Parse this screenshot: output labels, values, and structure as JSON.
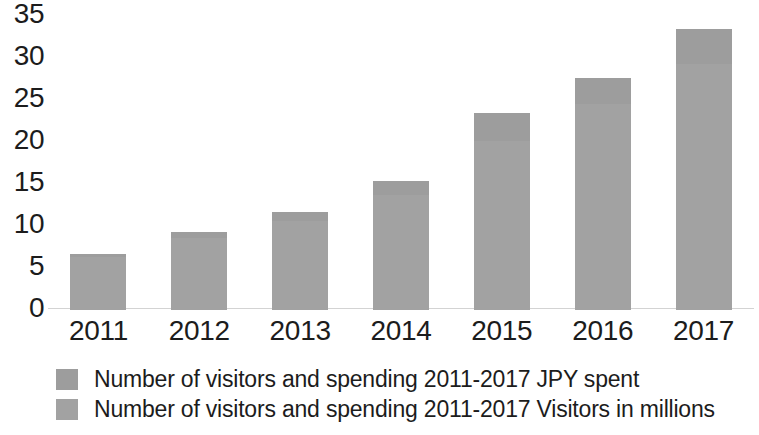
{
  "chart_data": {
    "type": "bar",
    "title": "",
    "subtitle": "",
    "xlabel": "",
    "ylabel": "",
    "categories": [
      "2011",
      "2012",
      "2013",
      "2014",
      "2015",
      "2016",
      "2017"
    ],
    "series": [
      {
        "name": "Number of visitors and spending 2011-2017 Visitors in millions",
        "color": "#a2a2a2",
        "values": [
          6.2,
          8.4,
          10.4,
          13.4,
          19.7,
          24.0,
          28.7
        ]
      },
      {
        "name": "Number of visitors and spending 2011-2017 JPY spent",
        "color": "#9d9d9d",
        "values": [
          0.3,
          0.7,
          1.0,
          1.7,
          3.3,
          3.1,
          4.1
        ]
      }
    ],
    "totals": [
      6.5,
      9.1,
      11.4,
      15.1,
      23.0,
      27.1,
      32.8
    ],
    "stacked": true,
    "ylim": [
      0,
      35
    ],
    "yticks": [
      "0",
      "5",
      "10",
      "15",
      "20",
      "25",
      "30",
      "35"
    ],
    "ytick_values": [
      0,
      5,
      10,
      15,
      20,
      25,
      30,
      35
    ],
    "grid": false,
    "legend_position": "bottom"
  },
  "legend": {
    "entries": [
      {
        "label": "Number of visitors and spending 2011-2017 JPY spent",
        "color": "#9d9d9d"
      },
      {
        "label": "Number of visitors and spending 2011-2017 Visitors in millions",
        "color": "#a2a2a2"
      }
    ]
  },
  "axis": {
    "y_labels": [
      "35",
      "30",
      "25",
      "20",
      "15",
      "10",
      "5",
      "0"
    ],
    "x_labels": [
      "2011",
      "2012",
      "2013",
      "2014",
      "2015",
      "2016",
      "2017"
    ]
  },
  "colors": {
    "background": "#ffffff",
    "text": "#1c1c1c",
    "axis_line": "#d3d3d3",
    "series_spent": "#9d9d9d",
    "series_visitors": "#a2a2a2"
  }
}
